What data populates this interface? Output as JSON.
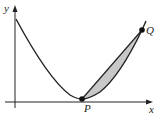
{
  "diagram": {
    "axes": {
      "x_label": "x",
      "y_label": "y"
    },
    "points": [
      {
        "name": "P",
        "label": "P",
        "px": [
          82,
          99
        ]
      },
      {
        "name": "Q",
        "label": "Q",
        "px": [
          142,
          30
        ]
      }
    ],
    "curve": {
      "description": "convex curve decreasing from top-left to minimum near P, then rising through Q"
    },
    "shaded_region": {
      "description": "region between chord PQ and the curve",
      "fill": "#c8c8c8"
    },
    "colors": {
      "stroke": "#222222",
      "shade": "#c8c8c8",
      "background": "#ffffff"
    }
  }
}
